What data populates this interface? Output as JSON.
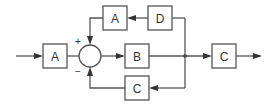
{
  "diagram": {
    "type": "block-diagram",
    "blocks": [
      {
        "id": "A1",
        "label": "A",
        "position": "input"
      },
      {
        "id": "B",
        "label": "B",
        "position": "forward"
      },
      {
        "id": "A2",
        "label": "A",
        "position": "feedback-top"
      },
      {
        "id": "D",
        "label": "D",
        "position": "feedback-top"
      },
      {
        "id": "C1",
        "label": "C",
        "position": "feedback-bottom"
      },
      {
        "id": "C2",
        "label": "C",
        "position": "output"
      }
    ],
    "summing_junction": {
      "plus_sign": "+",
      "minus_sign": "−"
    },
    "connections": [
      "input → A1",
      "A1 → summing junction",
      "summing junction → B",
      "B → branch point",
      "branch point → C2 → output",
      "branch point → D → A2 → summing junction (+)",
      "branch point → C1 → summing junction (−)"
    ],
    "colors": {
      "stroke": "#555555",
      "text": "#333333",
      "background": "#ffffff"
    }
  }
}
